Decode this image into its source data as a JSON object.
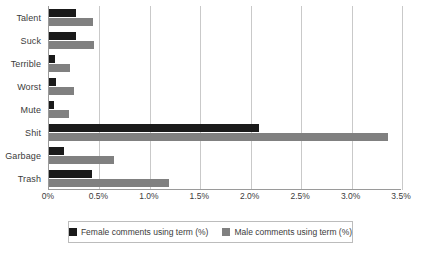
{
  "chart_data": {
    "type": "bar",
    "orientation": "horizontal",
    "title": "",
    "xlabel": "",
    "ylabel": "",
    "categories": [
      "Talent",
      "Suck",
      "Terrible",
      "Worst",
      "Mute",
      "Shit",
      "Garbage",
      "Trash"
    ],
    "series": [
      {
        "name": "Female comments using term (%)",
        "color": "#1a1a1a",
        "values": [
          0.27,
          0.27,
          0.06,
          0.07,
          0.05,
          2.08,
          0.15,
          0.43
        ]
      },
      {
        "name": "Male comments using term (%)",
        "color": "#808080",
        "values": [
          0.44,
          0.45,
          0.21,
          0.25,
          0.2,
          3.36,
          0.64,
          1.19
        ]
      }
    ],
    "xlim": [
      0,
      3.5
    ],
    "xticks": [
      0,
      0.5,
      1.0,
      1.5,
      2.0,
      2.5,
      3.0,
      3.5
    ],
    "xtick_labels": [
      "0%",
      "0.5%",
      "1.0%",
      "1.5%",
      "2.0%",
      "2.5%",
      "3.0%",
      "3.5%"
    ],
    "grid": true,
    "grid_axis": "x",
    "legend_position": "bottom",
    "legend_entries": [
      "Female comments using term (%)",
      "Male comments using term (%)"
    ]
  }
}
